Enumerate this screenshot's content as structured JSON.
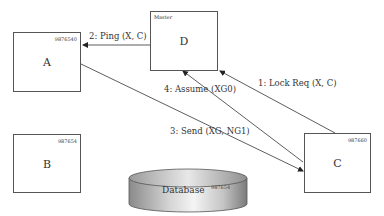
{
  "diagram": {
    "type": "sequence-network",
    "nodes": [
      {
        "key": "A",
        "name": "A",
        "id": "9876540",
        "tag": ""
      },
      {
        "key": "D",
        "name": "D",
        "id": "",
        "tag": "Master"
      },
      {
        "key": "B",
        "name": "B",
        "id": "987654",
        "tag": ""
      },
      {
        "key": "C",
        "name": "C",
        "id": "987660",
        "tag": ""
      }
    ],
    "database": {
      "label": "Database",
      "id": "987654"
    },
    "messages": [
      {
        "step": 1,
        "label": "1: Lock Req (X, C)",
        "from": "C",
        "to": "D"
      },
      {
        "step": 2,
        "label": "2: Ping (X, C)",
        "from": "D",
        "to": "A"
      },
      {
        "step": 3,
        "label": "3: Send (XG, NG1)",
        "from": "A",
        "to": "C"
      },
      {
        "step": 4,
        "label": "4: Assume (XG0)",
        "from": "C",
        "to": "D"
      }
    ],
    "colors": {
      "line": "#333333",
      "box_border": "#555555",
      "db_dark": "#8c8c8c",
      "db_light": "#f2f2f2"
    }
  }
}
